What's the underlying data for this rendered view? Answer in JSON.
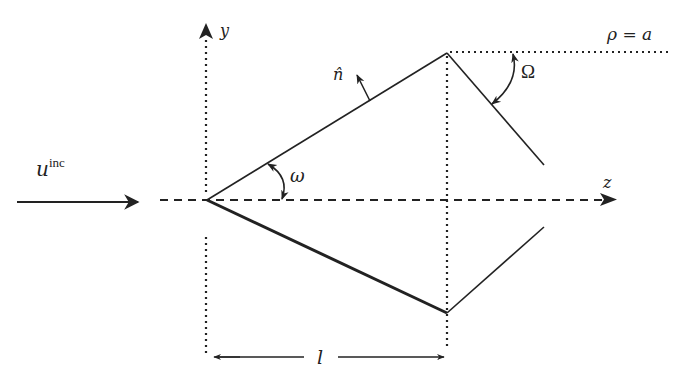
{
  "diagram": {
    "labels": {
      "y_axis": "y",
      "z_axis": "z",
      "normal": "n̂",
      "incident_wave_base": "u",
      "incident_wave_sup": "inc",
      "omega": "ω",
      "Omega": "Ω",
      "radius": "ρ = a",
      "length": "l"
    },
    "colors": {
      "stroke": "#222222",
      "background": "#ffffff"
    }
  }
}
